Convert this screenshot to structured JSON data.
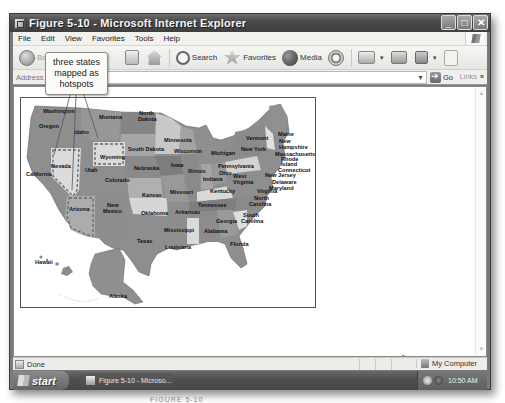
{
  "window": {
    "title": "Figure 5-10 - Microsoft Internet Explorer",
    "controls": [
      "minimize",
      "maximize",
      "close"
    ]
  },
  "menubar": {
    "items": [
      "File",
      "Edit",
      "View",
      "Favorites",
      "Tools",
      "Help"
    ]
  },
  "toolbar": {
    "back_label": "Back",
    "search_label": "Search",
    "favorites_label": "Favorites",
    "media_label": "Media",
    "icons": [
      "back-icon",
      "refresh-icon",
      "home-icon",
      "search-icon",
      "favorites-icon",
      "media-icon",
      "history-icon",
      "mail-icon",
      "print-icon",
      "edit-icon",
      "messenger-icon"
    ]
  },
  "addressbar": {
    "label": "Address",
    "value": "",
    "go_label": "Go",
    "links_label": "Links",
    "links_more": "»"
  },
  "callout": {
    "line1": "three states",
    "line2": "mapped as",
    "line3": "hotspots"
  },
  "map": {
    "hotspot_states": [
      "Nevada",
      "Wyoming",
      "Arizona"
    ],
    "states": [
      {
        "name": "Washington",
        "x": 22,
        "y": 15
      },
      {
        "name": "Oregon",
        "x": 18,
        "y": 30
      },
      {
        "name": "Idaho",
        "x": 53,
        "y": 36
      },
      {
        "name": "Montana",
        "x": 78,
        "y": 21
      },
      {
        "name": "North",
        "x": 118,
        "y": 17
      },
      {
        "name": "Dakota",
        "x": 117,
        "y": 23
      },
      {
        "name": "South Dakota",
        "x": 107,
        "y": 53
      },
      {
        "name": "Wyoming",
        "x": 79,
        "y": 61
      },
      {
        "name": "Nevada",
        "x": 30,
        "y": 70
      },
      {
        "name": "California",
        "x": 5,
        "y": 78
      },
      {
        "name": "Utah",
        "x": 64,
        "y": 74
      },
      {
        "name": "Colorado",
        "x": 84,
        "y": 84
      },
      {
        "name": "Nebraska",
        "x": 113,
        "y": 72
      },
      {
        "name": "Kansas",
        "x": 121,
        "y": 99
      },
      {
        "name": "Arizona",
        "x": 48,
        "y": 113
      },
      {
        "name": "New",
        "x": 86,
        "y": 109
      },
      {
        "name": "Mexico",
        "x": 82,
        "y": 115
      },
      {
        "name": "Oklahoma",
        "x": 120,
        "y": 117
      },
      {
        "name": "Texas",
        "x": 116,
        "y": 145
      },
      {
        "name": "Minnesota",
        "x": 143,
        "y": 44
      },
      {
        "name": "Wisconsin",
        "x": 153,
        "y": 55
      },
      {
        "name": "Iowa",
        "x": 150,
        "y": 69
      },
      {
        "name": "Illinois",
        "x": 167,
        "y": 75
      },
      {
        "name": "Missouri",
        "x": 149,
        "y": 96
      },
      {
        "name": "Arkansas",
        "x": 154,
        "y": 116
      },
      {
        "name": "Mississippi",
        "x": 143,
        "y": 134
      },
      {
        "name": "Louisiana",
        "x": 144,
        "y": 151
      },
      {
        "name": "Michigan",
        "x": 190,
        "y": 57
      },
      {
        "name": "Indiana",
        "x": 182,
        "y": 83
      },
      {
        "name": "Ohio",
        "x": 198,
        "y": 77
      },
      {
        "name": "Kentucky",
        "x": 189,
        "y": 95
      },
      {
        "name": "Tennessee",
        "x": 177,
        "y": 109
      },
      {
        "name": "Alabama",
        "x": 183,
        "y": 135
      },
      {
        "name": "Georgia",
        "x": 195,
        "y": 125
      },
      {
        "name": "Florida",
        "x": 209,
        "y": 148
      },
      {
        "name": "South",
        "x": 222,
        "y": 119
      },
      {
        "name": "Carolina",
        "x": 220,
        "y": 125
      },
      {
        "name": "North",
        "x": 233,
        "y": 102
      },
      {
        "name": "Carolina",
        "x": 228,
        "y": 108
      },
      {
        "name": "Virginia",
        "x": 236,
        "y": 95
      },
      {
        "name": "West",
        "x": 212,
        "y": 80
      },
      {
        "name": "Virginia",
        "x": 212,
        "y": 86
      },
      {
        "name": "Pennsylvania",
        "x": 197,
        "y": 70
      },
      {
        "name": "New York",
        "x": 220,
        "y": 53
      },
      {
        "name": "Vermont",
        "x": 225,
        "y": 42
      },
      {
        "name": "Maine",
        "x": 257,
        "y": 38
      },
      {
        "name": "New",
        "x": 258,
        "y": 45
      },
      {
        "name": "Hampshire",
        "x": 258,
        "y": 51
      },
      {
        "name": "Massachusetts",
        "x": 254,
        "y": 58
      },
      {
        "name": "Rhode",
        "x": 260,
        "y": 63
      },
      {
        "name": "Island",
        "x": 260,
        "y": 68
      },
      {
        "name": "Connecticut",
        "x": 257,
        "y": 74
      },
      {
        "name": "New Jersey",
        "x": 244,
        "y": 79
      },
      {
        "name": "Delaware",
        "x": 251,
        "y": 86
      },
      {
        "name": "Maryland",
        "x": 248,
        "y": 92
      },
      {
        "name": "Hawaii",
        "x": 14,
        "y": 166
      },
      {
        "name": "Alaska",
        "x": 88,
        "y": 200
      }
    ]
  },
  "statusbar": {
    "text": "Done",
    "zone": "My Computer"
  },
  "taskbar": {
    "start_label": "start",
    "task_label": "Figure 5-10 - Microso...",
    "clock": "10:50 AM"
  },
  "caption": "FIGURE 5-10"
}
